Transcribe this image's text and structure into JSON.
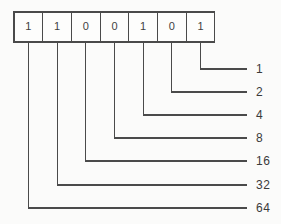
{
  "diagram": {
    "background_color": "#fbfbfa",
    "stroke_color": "#4a4a4a",
    "text_color": "#3a3a3a",
    "bit_count": 7,
    "bits": [
      {
        "index": 0,
        "value": "1",
        "place_value": "64"
      },
      {
        "index": 1,
        "value": "1",
        "place_value": "32"
      },
      {
        "index": 2,
        "value": "0",
        "place_value": "16"
      },
      {
        "index": 3,
        "value": "0",
        "place_value": "8"
      },
      {
        "index": 4,
        "value": "1",
        "place_value": "4"
      },
      {
        "index": 5,
        "value": "0",
        "place_value": "2"
      },
      {
        "index": 6,
        "value": "1",
        "place_value": "1"
      }
    ],
    "place_value_labels": [
      "1",
      "2",
      "4",
      "8",
      "16",
      "32",
      "64"
    ],
    "bit_string": "1100101"
  },
  "geometry": {
    "boxes": {
      "left": 14,
      "top": 12,
      "width": 28.7,
      "height": 30
    },
    "label_x": 256,
    "leader_end_x": 247,
    "leader_start_x": 237,
    "rows": [
      {
        "label": "1",
        "elbow_x": 201.6,
        "y": 69
      },
      {
        "label": "2",
        "elbow_x": 172.9,
        "y": 92
      },
      {
        "label": "4",
        "elbow_x": 144.2,
        "y": 115
      },
      {
        "label": "8",
        "elbow_x": 115.5,
        "y": 138
      },
      {
        "label": "16",
        "elbow_x": 86.8,
        "y": 161
      },
      {
        "label": "32",
        "elbow_x": 58.1,
        "y": 185
      },
      {
        "label": "64",
        "elbow_x": 29.4,
        "y": 208
      }
    ]
  }
}
